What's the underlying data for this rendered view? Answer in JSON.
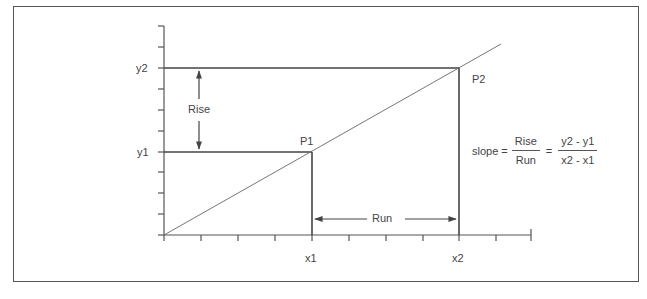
{
  "diagram": {
    "axes": {
      "y_labels": {
        "y2": "y2",
        "y1": "y1"
      },
      "x_labels": {
        "x1": "x1",
        "x2": "x2"
      }
    },
    "points": {
      "p1": "P1",
      "p2": "P2"
    },
    "annotations": {
      "rise": "Rise",
      "run": "Run"
    },
    "formula": {
      "lhs": "slope =",
      "frac1_num": "Rise",
      "frac1_den": "Run",
      "equals": "=",
      "frac2_num": "y2 - y1",
      "frac2_den": "x2 - x1"
    },
    "colors": {
      "line": "#555555",
      "text": "#444444",
      "frame": "#555555"
    }
  }
}
